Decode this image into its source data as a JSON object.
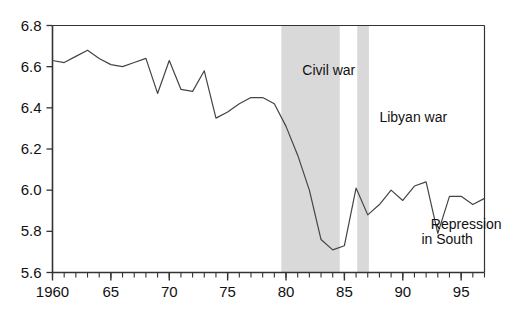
{
  "chart_data": {
    "type": "line",
    "title": "",
    "xlabel": "",
    "ylabel": "",
    "xlim": [
      1960,
      1997
    ],
    "ylim": [
      5.6,
      6.8
    ],
    "grid": false,
    "legend": false,
    "y_ticks": [
      "5.6",
      "5.8",
      "6.0",
      "6.2",
      "6.4",
      "6.6",
      "6.8"
    ],
    "y_tick_values": [
      5.6,
      5.8,
      6.0,
      6.2,
      6.4,
      6.6,
      6.8
    ],
    "x_ticks": [
      "1960",
      "65",
      "70",
      "75",
      "80",
      "85",
      "90",
      "95"
    ],
    "x_tick_values": [
      1960,
      1965,
      1970,
      1975,
      1980,
      1985,
      1990,
      1995
    ],
    "x_minor_step": 1,
    "line_color": "#444444",
    "band_color": "#d9d9d9",
    "x": [
      1960,
      1961,
      1962,
      1963,
      1964,
      1965,
      1966,
      1967,
      1968,
      1969,
      1970,
      1971,
      1972,
      1973,
      1974,
      1975,
      1976,
      1977,
      1978,
      1979,
      1980,
      1981,
      1982,
      1983,
      1984,
      1985,
      1986,
      1987,
      1988,
      1989,
      1990,
      1991,
      1992,
      1993,
      1994,
      1995,
      1996,
      1997
    ],
    "values": [
      6.63,
      6.62,
      6.65,
      6.68,
      6.64,
      6.61,
      6.6,
      6.62,
      6.64,
      6.47,
      6.63,
      6.49,
      6.48,
      6.58,
      6.35,
      6.38,
      6.42,
      6.45,
      6.45,
      6.42,
      6.31,
      6.17,
      6.0,
      5.76,
      5.71,
      5.73,
      6.01,
      5.88,
      5.93,
      6.0,
      5.95,
      6.02,
      6.04,
      5.79,
      5.97,
      5.97,
      5.93,
      5.96
    ],
    "bands": [
      {
        "label": "Civil war",
        "x_start": 1979.6,
        "x_end": 1984.6
      },
      {
        "label": "Libyan war",
        "x_start": 1986.1,
        "x_end": 1987.1
      }
    ],
    "annotations": [
      {
        "name": "civil-war-label",
        "text": "Civil war",
        "x": 1981.4,
        "y": 6.58
      },
      {
        "name": "libyan-war-label",
        "text": "Libyan war",
        "x": 1988.0,
        "y": 6.35
      },
      {
        "name": "repression-label-line1",
        "text": "Repression",
        "x": 1992.4,
        "y": 5.83
      },
      {
        "name": "repression-label-line2",
        "text": "in South",
        "x": 1991.6,
        "y": 5.76
      }
    ]
  },
  "annotations": {
    "civil_war": "Civil war",
    "libyan_war": "Libyan war",
    "repression_line1": "Repression",
    "repression_line2": "in South"
  }
}
